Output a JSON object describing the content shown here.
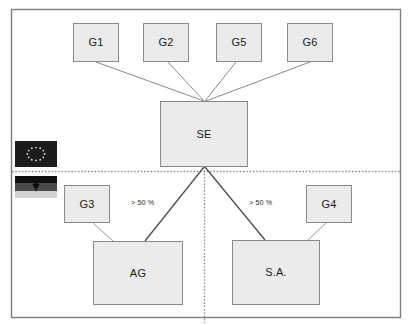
{
  "diagram": {
    "frame": {
      "stroke": "#7d7d7d"
    },
    "divider": {
      "horizontal_name": "eu-germany-divider",
      "vertical_name": "ag-sa-divider",
      "color": "#9a9a9a"
    },
    "nodes": [
      {
        "id": "g1",
        "label": "G1",
        "x": 73,
        "y": 23,
        "w": 46,
        "h": 39,
        "size": "small"
      },
      {
        "id": "g2",
        "label": "G2",
        "x": 143,
        "y": 23,
        "w": 46,
        "h": 39,
        "size": "small"
      },
      {
        "id": "g5",
        "label": "G5",
        "x": 216,
        "y": 23,
        "w": 46,
        "h": 39,
        "size": "small"
      },
      {
        "id": "g6",
        "label": "G6",
        "x": 287,
        "y": 23,
        "w": 46,
        "h": 39,
        "size": "small"
      },
      {
        "id": "se",
        "label": "SE",
        "x": 160,
        "y": 101,
        "w": 88,
        "h": 66,
        "size": "big"
      },
      {
        "id": "g3",
        "label": "G3",
        "x": 64,
        "y": 185,
        "w": 46,
        "h": 38,
        "size": "small"
      },
      {
        "id": "g4",
        "label": "G4",
        "x": 306,
        "y": 185,
        "w": 46,
        "h": 38,
        "size": "small"
      },
      {
        "id": "ag",
        "label": "AG",
        "x": 93,
        "y": 241,
        "w": 90,
        "h": 64,
        "size": "big"
      },
      {
        "id": "sa",
        "label": "S.A.",
        "x": 232,
        "y": 240,
        "w": 88,
        "h": 65,
        "size": "big"
      }
    ],
    "edges": [
      {
        "from": "g1",
        "to": "se",
        "name": "edge-g1-se",
        "label": ""
      },
      {
        "from": "g2",
        "to": "se",
        "name": "edge-g2-se",
        "label": ""
      },
      {
        "from": "g5",
        "to": "se",
        "name": "edge-g5-se",
        "label": ""
      },
      {
        "from": "g6",
        "to": "se",
        "name": "edge-g6-se",
        "label": ""
      },
      {
        "from": "se",
        "to": "ag",
        "name": "edge-se-ag",
        "label": "> 50 %"
      },
      {
        "from": "se",
        "to": "sa",
        "name": "edge-se-sa",
        "label": "> 50 %"
      },
      {
        "from": "g3",
        "to": "ag",
        "name": "edge-g3-ag",
        "label": ""
      },
      {
        "from": "g4",
        "to": "sa",
        "name": "edge-g4-sa",
        "label": ""
      }
    ],
    "edge_labels": {
      "left": {
        "text": "> 50 %",
        "x": 131,
        "y": 198
      },
      "right": {
        "text": "> 50 %",
        "x": 249,
        "y": 198
      }
    },
    "flags": [
      {
        "id": "eu",
        "name": "eu-flag",
        "alt": "European Union flag",
        "x": 15,
        "y": 141,
        "w": 42,
        "h": 26
      },
      {
        "id": "de",
        "name": "germany-flag",
        "alt": "Germany federal flag",
        "x": 15,
        "y": 176,
        "w": 42,
        "h": 22
      }
    ]
  }
}
